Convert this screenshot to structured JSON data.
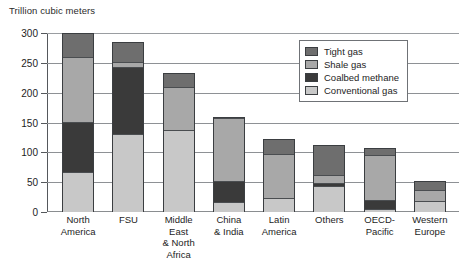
{
  "chart_data": {
    "type": "bar",
    "subtype": "stacked-vertical",
    "title": "",
    "ylabel": "Trillion cubic meters",
    "xlabel": "",
    "ylim": [
      0,
      300
    ],
    "yticks": [
      0,
      50,
      100,
      150,
      200,
      250,
      300
    ],
    "ytick_labels": [
      "0",
      "50",
      "100",
      "150",
      "200",
      "250",
      "300"
    ],
    "grid": "horizontal",
    "legend_position": "top-right-inside",
    "categories": [
      "North America",
      "FSU",
      "Middle East & North Africa",
      "China & India",
      "Latin America",
      "Others",
      "OECD-Pacific",
      "Western Europe"
    ],
    "series": [
      {
        "name": "Conventional gas",
        "color": "#c8c8c8",
        "values": [
          65,
          130,
          137,
          15,
          22,
          43,
          3,
          17
        ]
      },
      {
        "name": "Coalbed methane",
        "color": "#3a3a3a",
        "values": [
          85,
          113,
          0,
          35,
          0,
          5,
          15,
          0
        ]
      },
      {
        "name": "Shale gas",
        "color": "#a8a8a8",
        "values": [
          110,
          9,
          73,
          107,
          75,
          14,
          77,
          20
        ]
      },
      {
        "name": "Tight gas",
        "color": "#6e6e6e",
        "values": [
          40,
          33,
          23,
          3,
          26,
          50,
          12,
          15
        ]
      }
    ],
    "totals": [
      300,
      285,
      233,
      160,
      123,
      112,
      107,
      52
    ]
  },
  "legend": {
    "items": [
      {
        "label": "Tight gas",
        "color": "#6e6e6e"
      },
      {
        "label": "Shale gas",
        "color": "#a8a8a8"
      },
      {
        "label": "Coalbed methane",
        "color": "#3a3a3a"
      },
      {
        "label": "Conventional gas",
        "color": "#c8c8c8"
      }
    ]
  },
  "xtick_labels": [
    [
      "North",
      "America"
    ],
    [
      "FSU"
    ],
    [
      "Middle East",
      "& North",
      "Africa"
    ],
    [
      "China",
      "& India"
    ],
    [
      "Latin",
      "America"
    ],
    [
      "Others"
    ],
    [
      "OECD-",
      "Pacific"
    ],
    [
      "Western",
      "Europe"
    ]
  ]
}
